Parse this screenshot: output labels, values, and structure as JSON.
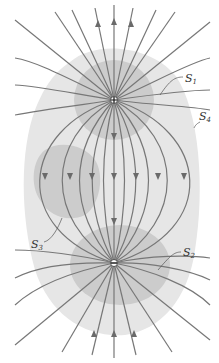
{
  "diagram": {
    "charges": [
      {
        "id": "positive",
        "sign": "+",
        "x": 114,
        "y": 100
      },
      {
        "id": "negative",
        "sign": "−",
        "x": 114,
        "y": 263
      }
    ],
    "surfaces": [
      {
        "id": "S1",
        "label": "S",
        "sub": "1",
        "label_x": 183,
        "label_y": 80
      },
      {
        "id": "S2",
        "label": "S",
        "sub": "2",
        "label_x": 183,
        "label_y": 254
      },
      {
        "id": "S3",
        "label": "S",
        "sub": "3",
        "label_x": 31,
        "label_y": 246
      },
      {
        "id": "S4",
        "label": "S",
        "sub": "4",
        "label_x": 200,
        "label_y": 124
      }
    ],
    "colors": {
      "outer_shade": "#e6e6e6",
      "inner_shade": "#cccccc",
      "field_line": "#777777",
      "arrow": "#6a6a6a",
      "label": "#333333"
    }
  }
}
